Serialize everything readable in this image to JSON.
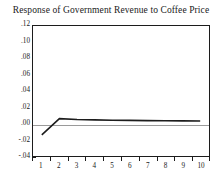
{
  "chart_data": {
    "type": "line",
    "title": "Response of Government Revenue to Coffee Price",
    "xlabel": "",
    "ylabel": "",
    "x": [
      1,
      2,
      3,
      4,
      5,
      6,
      7,
      8,
      9,
      10
    ],
    "categories": [
      "1",
      "2",
      "3",
      "4",
      "5",
      "6",
      "7",
      "8",
      "9",
      "10"
    ],
    "values": [
      -0.014,
      0.006,
      0.005,
      0.0045,
      0.004,
      0.0038,
      0.0035,
      0.0033,
      0.0032,
      0.003
    ],
    "series": [
      {
        "name": "Government Revenue response",
        "values": [
          -0.014,
          0.006,
          0.005,
          0.0045,
          0.004,
          0.0038,
          0.0035,
          0.0033,
          0.0032,
          0.003
        ],
        "color": "#1c1c1c"
      }
    ],
    "ylim": [
      -0.04,
      0.12
    ],
    "xlim": [
      1,
      10
    ],
    "yticks": [
      0.12,
      0.1,
      0.08,
      0.06,
      0.04,
      0.02,
      0.0,
      -0.02,
      -0.04
    ],
    "ytick_labels": [
      ".12",
      ".10",
      ".08",
      ".06",
      ".04",
      ".02",
      ".00",
      "-.02",
      "-.04"
    ],
    "xticks": [
      1,
      2,
      3,
      4,
      5,
      6,
      7,
      8,
      9,
      10
    ],
    "xtick_labels": [
      "1",
      "2",
      "3",
      "4",
      "5",
      "6",
      "7",
      "8",
      "9",
      "10"
    ],
    "grid": false,
    "zero_line": true,
    "zero_line_color": "#9a9a9a",
    "legend": null,
    "frame_color": "#1c1c1c",
    "background": "#ffffff"
  }
}
